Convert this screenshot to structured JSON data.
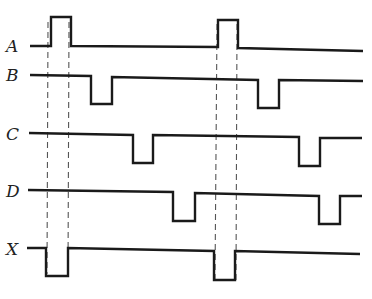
{
  "diagram": {
    "type": "timing-diagram",
    "colors": {
      "wave": "#1a1a1a",
      "guide": "#555555",
      "label": "#222222",
      "background": "#ffffff"
    },
    "signals": [
      {
        "name": "A",
        "label_pos": [
          6,
          52
        ],
        "points": "30,46 51,46 51,17 71,17 71,46 218,47 218,20 238,20 238,48 363,51"
      },
      {
        "name": "B",
        "label_pos": [
          6,
          81
        ],
        "points": "30,75 91,76 91,104 112,104 112,77 258,80 258,108 279,108 279,80 363,81"
      },
      {
        "name": "C",
        "label_pos": [
          6,
          140
        ],
        "points": "29,133 133,135 133,163 153,163 153,135 299,137 299,166 320,166 320,138 362,138"
      },
      {
        "name": "D",
        "label_pos": [
          6,
          197
        ],
        "points": "28,190 173,192 173,221 195,221 195,193 319,196 319,224 340,224 340,196 362,196"
      },
      {
        "name": "X",
        "label_pos": [
          6,
          255
        ],
        "points": "27,248 46,248 46,276 68,276 68,248 214,251 214,280 235,280 235,251 360,254"
      }
    ],
    "guides": [
      {
        "x1": 48,
        "y1": 22,
        "x2": 47,
        "y2": 274
      },
      {
        "x1": 69,
        "y1": 22,
        "x2": 68,
        "y2": 274
      },
      {
        "x1": 217,
        "y1": 24,
        "x2": 215,
        "y2": 280
      },
      {
        "x1": 237,
        "y1": 24,
        "x2": 236,
        "y2": 280
      }
    ]
  }
}
